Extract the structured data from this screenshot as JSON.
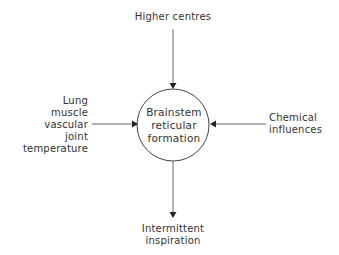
{
  "diagram": {
    "center_node": {
      "lines": [
        "Brainstem",
        "reticular",
        "formation"
      ]
    },
    "inputs": {
      "top": {
        "lines": [
          "Higher centres"
        ]
      },
      "left": {
        "lines": [
          "Lung",
          "muscle",
          "vascular",
          "joint",
          "temperature"
        ]
      },
      "right": {
        "lines": [
          "Chemical",
          "influences"
        ]
      }
    },
    "output": {
      "bottom": {
        "lines": [
          "Intermittent",
          "inspiration"
        ]
      }
    },
    "colors": {
      "line": "#555555",
      "arrowhead": "#222222",
      "text": "#333333",
      "background": "#ffffff"
    }
  }
}
